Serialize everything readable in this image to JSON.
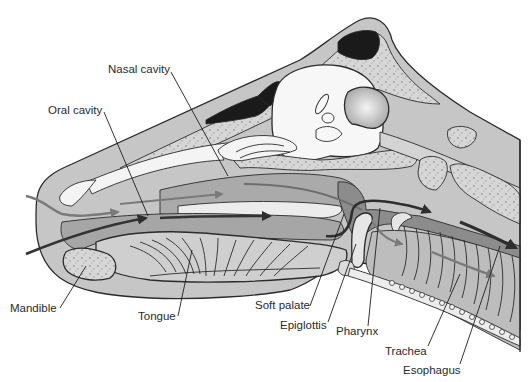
{
  "figure": {
    "colors": {
      "background": "#ffffff",
      "soft_tissue": "#c4c4c4",
      "mid_gray": "#a9a9a9",
      "dark_gray": "#8a8a8a",
      "bone": "#d9d9d9",
      "sinus": "#1a1a1a",
      "airflow_arrow": "#7a7a7a",
      "food_arrow": "#3a3a3a",
      "outline": "#2b2b2b",
      "label_text": "#2a2a2a"
    }
  },
  "labels": [
    {
      "id": "nasal-cavity",
      "text": "Nasal cavity"
    },
    {
      "id": "oral-cavity",
      "text": "Oral cavity"
    },
    {
      "id": "mandible",
      "text": "Mandible"
    },
    {
      "id": "tongue",
      "text": "Tongue"
    },
    {
      "id": "soft-palate",
      "text": "Soft palate"
    },
    {
      "id": "epiglottis",
      "text": "Epiglottis"
    },
    {
      "id": "pharynx",
      "text": "Pharynx"
    },
    {
      "id": "trachea",
      "text": "Trachea"
    },
    {
      "id": "esophagus",
      "text": "Esophagus"
    }
  ],
  "arrows": [
    {
      "id": "air-intake",
      "meaning": "airflow through nasal passage"
    },
    {
      "id": "food-path",
      "meaning": "food path through oral cavity to esophagus"
    },
    {
      "id": "air-to-trachea",
      "meaning": "airflow into trachea"
    }
  ]
}
